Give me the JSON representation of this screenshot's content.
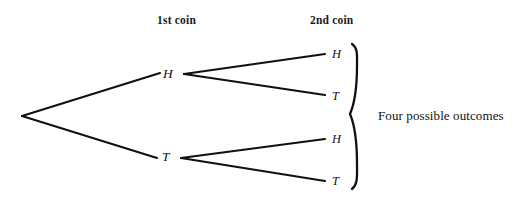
{
  "diagram": {
    "background_color": "#ffffff",
    "stroke_color": "#111111",
    "headers": {
      "first_coin": "1st coin",
      "second_coin": "2nd coin"
    },
    "level1_nodes": [
      {
        "label": "H",
        "outcome": "heads"
      },
      {
        "label": "T",
        "outcome": "tails"
      }
    ],
    "leaf_nodes": [
      {
        "label": "H",
        "outcome": "heads"
      },
      {
        "label": "T",
        "outcome": "tails"
      },
      {
        "label": "H",
        "outcome": "heads"
      },
      {
        "label": "T",
        "outcome": "tails"
      }
    ],
    "annotation": "Four possible outcomes",
    "brace": "right-curly-brace"
  }
}
